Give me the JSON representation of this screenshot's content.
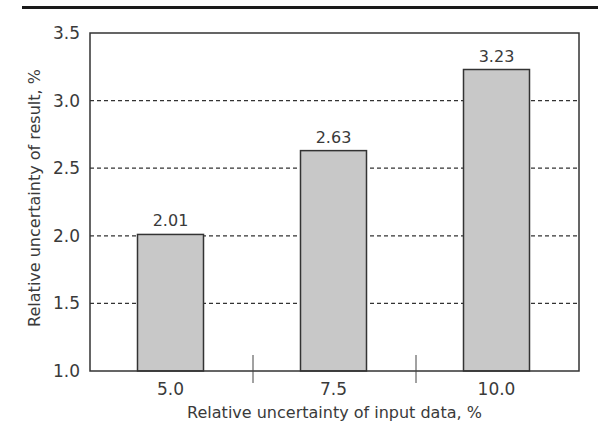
{
  "chart_data": {
    "type": "bar",
    "title": "",
    "xlabel": "Relative uncertainty of input data, %",
    "ylabel": "Relative uncertainty of result, %",
    "categories": [
      "5.0",
      "7.5",
      "10.0"
    ],
    "values": [
      2.01,
      2.63,
      3.23
    ],
    "value_labels": [
      "2.01",
      "2.63",
      "3.23"
    ],
    "ylim": [
      1.0,
      3.5
    ],
    "yticks": [
      "1.0",
      "1.5",
      "2.0",
      "2.5",
      "3.0",
      "3.5"
    ],
    "grid": "horizontal dashed",
    "legend": null,
    "bar_color": "#c8c8c8",
    "bar_edge_color": "#333333"
  }
}
